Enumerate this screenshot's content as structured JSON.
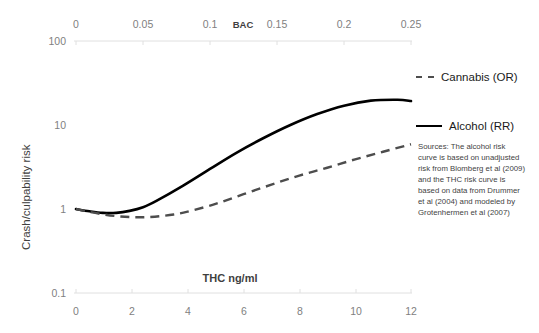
{
  "chart_data": {
    "type": "line",
    "title": "",
    "xlabel": "THC ng/ml",
    "xlabel_secondary": "BAC",
    "ylabel": "Crash/culpability risk",
    "yscale": "log",
    "ylim": [
      0.1,
      100
    ],
    "y_ticks": [
      "100",
      "10",
      "1",
      "0.1"
    ],
    "y_tick_values": [
      100,
      10,
      1,
      0.1
    ],
    "x_ticks_bottom": [
      "0",
      "2",
      "4",
      "6",
      "8",
      "10",
      "12"
    ],
    "x_tick_values_bottom": [
      0,
      2,
      4,
      6,
      8,
      10,
      12
    ],
    "xlim_bottom": [
      0,
      12
    ],
    "x_ticks_top": [
      "0",
      "0.05",
      "0.1",
      "0.15",
      "0.2",
      "0.25"
    ],
    "x_tick_values_top": [
      0,
      0.05,
      0.1,
      0.15,
      0.2,
      0.25
    ],
    "xlim_top": [
      0,
      0.25
    ],
    "grid": false,
    "legend_position": "right",
    "series": [
      {
        "name": "Cannabis (OR)",
        "style": "dashed",
        "color": "#4d4d4d",
        "x_axis": "bottom",
        "x": [
          0,
          0.5,
          1,
          1.5,
          2,
          2.5,
          3,
          3.5,
          4,
          5,
          6,
          7,
          8,
          9,
          10,
          11,
          12
        ],
        "values": [
          1.0,
          0.92,
          0.86,
          0.82,
          0.8,
          0.8,
          0.82,
          0.86,
          0.93,
          1.15,
          1.5,
          1.95,
          2.5,
          3.1,
          3.9,
          4.8,
          5.9
        ]
      },
      {
        "name": "Alcohol (RR)",
        "style": "solid",
        "color": "#000000",
        "x_axis": "top",
        "x": [
          0,
          0.01,
          0.02,
          0.03,
          0.04,
          0.05,
          0.06,
          0.08,
          0.1,
          0.12,
          0.14,
          0.16,
          0.18,
          0.2,
          0.22,
          0.24,
          0.25
        ],
        "values": [
          1.0,
          0.94,
          0.9,
          0.9,
          0.95,
          1.05,
          1.25,
          1.9,
          3.0,
          4.7,
          7.0,
          10.0,
          13.5,
          17.0,
          19.5,
          20.0,
          19.3
        ]
      }
    ],
    "annotations": [
      {
        "name": "sources-note",
        "text": "Sources: The alcohol risk curve is based on unadjusted risk from Blomberg et al (2009) and the THC risk curve is based on data from Drummer et al (2004) and modeled by Grotenhermen et al (2007)"
      }
    ]
  },
  "legend": {
    "items": [
      {
        "label": "Cannabis (OR)",
        "style": "dashed"
      },
      {
        "label": "Alcohol (RR)",
        "style": "solid"
      }
    ]
  },
  "axes": {
    "top": {
      "title": "BAC",
      "ticks": [
        "0",
        "0.05",
        "0.1",
        "0.15",
        "0.2",
        "0.25"
      ]
    },
    "bottom": {
      "title": "THC ng/ml",
      "ticks": [
        "0",
        "2",
        "4",
        "6",
        "8",
        "10",
        "12"
      ]
    },
    "left": {
      "title": "Crash/culpability risk",
      "ticks": [
        "100",
        "10",
        "1",
        "0.1"
      ]
    }
  },
  "notes": {
    "sources": "Sources: The alcohol risk curve is based on unadjusted risk from Blomberg et al (2009) and the THC risk curve is based on data from Drummer et al (2004) and modeled by Grotenhermen et al (2007)"
  }
}
